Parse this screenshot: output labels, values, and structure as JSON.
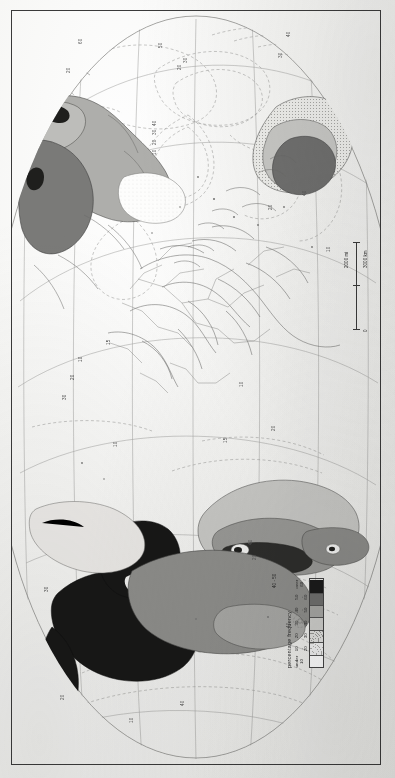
{
  "plate": {
    "kind": "world-map-plate",
    "projection_note": "oval world projection, page rotated 90 degrees"
  },
  "legend": {
    "title": "percentage  frequency",
    "classes": [
      {
        "label": "under 10",
        "fill": "#ffffff",
        "pattern": "blank"
      },
      {
        "label": "10\n-\n20",
        "fill": "#f2f2f2",
        "pattern": "fine-dot"
      },
      {
        "label": "20\n-\n30",
        "fill": "#e3e3e1",
        "pattern": "dot"
      },
      {
        "label": "30\n-\n40",
        "fill": "#cfcfcc",
        "pattern": "light-grey"
      },
      {
        "label": "40\n-\n50",
        "fill": "#a8a8a5",
        "pattern": "mid-grey"
      },
      {
        "label": "50\n-\n60",
        "fill": "#6f6f6e",
        "pattern": "dark-grey"
      },
      {
        "label": "over\n60",
        "fill": "#1b1b1b",
        "pattern": "black"
      }
    ]
  },
  "scalebar": {
    "zero": "0",
    "miles": "2000 mi",
    "kilometres": "3000 km"
  },
  "annotations": {
    "inset_class": "40 - 50"
  },
  "graticule_labels": [
    {
      "text": "60",
      "x": 78,
      "y": 44
    },
    {
      "text": "50",
      "x": 158,
      "y": 48
    },
    {
      "text": "30",
      "x": 183,
      "y": 63
    },
    {
      "text": "20",
      "x": 177,
      "y": 70
    },
    {
      "text": "20",
      "x": 66,
      "y": 73
    },
    {
      "text": "40",
      "x": 286,
      "y": 37
    },
    {
      "text": "30",
      "x": 278,
      "y": 58
    },
    {
      "text": "40",
      "x": 152,
      "y": 126
    },
    {
      "text": "30",
      "x": 152,
      "y": 135
    },
    {
      "text": "20",
      "x": 152,
      "y": 145
    },
    {
      "text": "10",
      "x": 152,
      "y": 155
    },
    {
      "text": "40",
      "x": 302,
      "y": 196
    },
    {
      "text": "20",
      "x": 268,
      "y": 210
    },
    {
      "text": "10",
      "x": 326,
      "y": 252
    },
    {
      "text": "15",
      "x": 106,
      "y": 345
    },
    {
      "text": "10",
      "x": 78,
      "y": 362
    },
    {
      "text": "20",
      "x": 70,
      "y": 380
    },
    {
      "text": "30",
      "x": 62,
      "y": 400
    },
    {
      "text": "10",
      "x": 239,
      "y": 387
    },
    {
      "text": "20",
      "x": 271,
      "y": 431
    },
    {
      "text": "15",
      "x": 223,
      "y": 443
    },
    {
      "text": "10",
      "x": 113,
      "y": 447
    },
    {
      "text": "30",
      "x": 44,
      "y": 592
    },
    {
      "text": "20",
      "x": 252,
      "y": 560
    },
    {
      "text": "40",
      "x": 248,
      "y": 545
    },
    {
      "text": "40",
      "x": 286,
      "y": 628
    },
    {
      "text": "40",
      "x": 180,
      "y": 706
    },
    {
      "text": "20",
      "x": 60,
      "y": 700
    },
    {
      "text": "10",
      "x": 129,
      "y": 723
    }
  ],
  "colors": {
    "ink": "#3a3a3a",
    "isoline": "#8a8a8a",
    "grid": "#9a9a9a",
    "paper": "#f6f6f4",
    "class_black": "#1b1b1b",
    "class_dark": "#6f6f6e",
    "class_mid": "#a8a8a5",
    "class_light": "#cfcfcc",
    "class_pale": "#e3e3e1",
    "class_faint": "#f2f2f2"
  }
}
